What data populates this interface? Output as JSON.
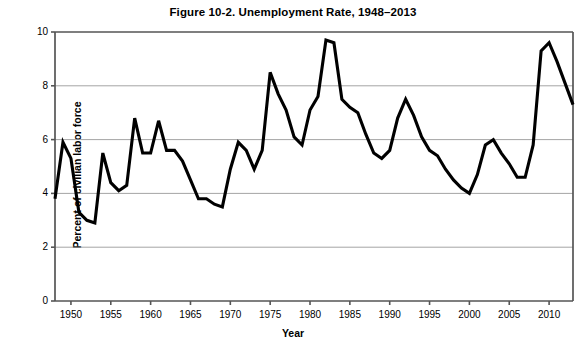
{
  "chart_data": {
    "type": "line",
    "title": "Figure 10-2. Unemployment Rate, 1948–2013",
    "xlabel": "Year",
    "ylabel": "Percent of civilian labor force",
    "xlim": [
      1948,
      2013
    ],
    "ylim": [
      0,
      10
    ],
    "ytick_values": [
      0,
      2,
      4,
      6,
      8,
      10
    ],
    "ytick_labels": [
      "0",
      "2",
      "4",
      "6",
      "8",
      "10"
    ],
    "xtick_values": [
      1950,
      1955,
      1960,
      1965,
      1970,
      1975,
      1980,
      1985,
      1990,
      1995,
      2000,
      2005,
      2010
    ],
    "xtick_labels": [
      "1950",
      "1955",
      "1960",
      "1965",
      "1970",
      "1975",
      "1980",
      "1985",
      "1990",
      "1995",
      "2000",
      "2005",
      "2010"
    ],
    "grid": "horizontal",
    "legend": "none",
    "line_color": "#000000",
    "line_width": 3.1,
    "grid_color": "#9a9a9a",
    "axis_color": "#555555",
    "background": "#ffffff",
    "x": [
      1948,
      1949,
      1950,
      1951,
      1952,
      1953,
      1954,
      1955,
      1956,
      1957,
      1958,
      1959,
      1960,
      1961,
      1962,
      1963,
      1964,
      1965,
      1966,
      1967,
      1968,
      1969,
      1970,
      1971,
      1972,
      1973,
      1974,
      1975,
      1976,
      1977,
      1978,
      1979,
      1980,
      1981,
      1982,
      1983,
      1984,
      1985,
      1986,
      1987,
      1988,
      1989,
      1990,
      1991,
      1992,
      1993,
      1994,
      1995,
      1996,
      1997,
      1998,
      1999,
      2000,
      2001,
      2002,
      2003,
      2004,
      2005,
      2006,
      2007,
      2008,
      2009,
      2010,
      2011,
      2012,
      2013
    ],
    "values": [
      3.8,
      5.9,
      5.3,
      3.3,
      3.0,
      2.9,
      5.5,
      4.4,
      4.1,
      4.3,
      6.8,
      5.5,
      5.5,
      6.7,
      5.6,
      5.6,
      5.2,
      4.5,
      3.8,
      3.8,
      3.6,
      3.5,
      4.9,
      5.9,
      5.6,
      4.9,
      5.6,
      8.5,
      7.7,
      7.1,
      6.1,
      5.8,
      7.1,
      7.6,
      9.7,
      9.6,
      7.5,
      7.2,
      7.0,
      6.2,
      5.5,
      5.3,
      5.6,
      6.8,
      7.5,
      6.9,
      6.1,
      5.6,
      5.4,
      4.9,
      4.5,
      4.2,
      4.0,
      4.7,
      5.8,
      6.0,
      5.5,
      5.1,
      4.6,
      4.6,
      5.8,
      9.3,
      9.6,
      8.9,
      8.1,
      7.3
    ]
  }
}
